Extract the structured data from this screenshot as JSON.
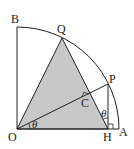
{
  "diagram": {
    "type": "geometry",
    "points": {
      "O": {
        "label": "O",
        "x": 17,
        "y": 129
      },
      "A": {
        "label": "A",
        "x": 119,
        "y": 129
      },
      "B": {
        "label": "B",
        "x": 17,
        "y": 27
      },
      "Q": {
        "label": "Q",
        "x": 62,
        "y": 38
      },
      "P": {
        "label": "P",
        "x": 108,
        "y": 84
      },
      "H": {
        "label": "H",
        "x": 108,
        "y": 129
      },
      "C": {
        "label": "C",
        "x": 86,
        "y": 95
      }
    },
    "angles": [
      {
        "label": "θ",
        "at": "O",
        "between": [
          "A",
          "P"
        ]
      },
      {
        "label": "θ",
        "at": "H",
        "between": [
          "P",
          "Q"
        ]
      }
    ],
    "right_angles": [
      "H",
      "C"
    ],
    "shaded_region": "triangle OQH",
    "colors": {
      "stroke": "#222222",
      "fill": "#c8c8c8",
      "background": "#ffffff"
    }
  }
}
